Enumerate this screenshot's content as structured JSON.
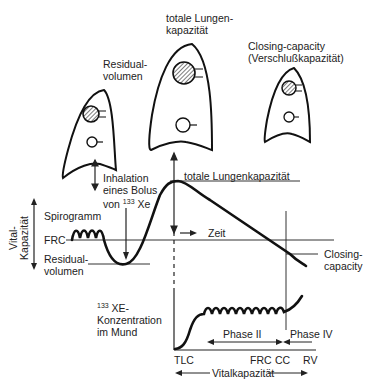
{
  "lungs": {
    "residual": {
      "title_line1": "Residual-",
      "title_line2": "volumen"
    },
    "total": {
      "title_line1": "totale Lungen-",
      "title_line2": "kapazität"
    },
    "closing": {
      "title_line1": "Closing-capacity",
      "title_line2": "(Verschlußkapazität)"
    }
  },
  "spirogram": {
    "inhalation_line1": "Inhalation",
    "inhalation_line2": "eines Bolus",
    "inhalation_line3_pre": "von ",
    "inhalation_sup": "133",
    "inhalation_line3_post": " Xe",
    "tlc_label": "totale Lungenkapazität",
    "spirogramm_label": "Spirogramm",
    "frc_label": "FRC",
    "residual_line1": "Residual-",
    "residual_line2": "volumen",
    "vital_line1": "Vital-",
    "vital_line2": "Kapazität",
    "time_label": "Zeit",
    "closing_line1": "Closing-",
    "closing_line2": "capacity"
  },
  "concentration": {
    "label_sup": "133",
    "label_line1": " XE-",
    "label_line2": "Konzentration",
    "label_line3": "im Mund",
    "phase2": "Phase II",
    "phase4": "Phase IV",
    "ticks": [
      "TLC",
      "FRC",
      "CC",
      "RV"
    ],
    "vital_label": "Vitalkapazität"
  }
}
